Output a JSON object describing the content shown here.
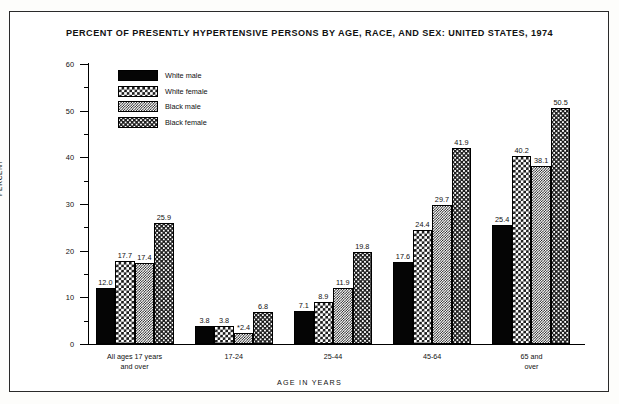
{
  "chart_data": {
    "type": "bar",
    "title": "PERCENT OF PRESENTLY HYPERTENSIVE PERSONS BY AGE, RACE, AND SEX: UNITED STATES, 1974",
    "xlabel": "AGE IN YEARS",
    "ylabel": "PERCENT",
    "ylim": [
      0,
      60
    ],
    "yticks": [
      0,
      10,
      20,
      30,
      40,
      50,
      60
    ],
    "yticks_minor": [
      5,
      15,
      25,
      35,
      45,
      55
    ],
    "ytick_labels": [
      "0",
      "10",
      "20",
      "30",
      "40",
      "50",
      "60"
    ],
    "grid": false,
    "legend_position": "upper-left-inside",
    "categories": [
      "All ages 17 years and over",
      "17-24",
      "25-44",
      "45-64",
      "65 and over"
    ],
    "category_lines": [
      [
        "All ages 17 years",
        "and over"
      ],
      [
        "17-24"
      ],
      [
        "25-44"
      ],
      [
        "45-64"
      ],
      [
        "65 and",
        "over"
      ]
    ],
    "series": [
      {
        "name": "White male",
        "pattern": "solid-black",
        "values": [
          12.0,
          3.8,
          7.1,
          17.6,
          25.4
        ],
        "labels": [
          "12.0",
          "3.8",
          "7.1",
          "17.6",
          "25.4"
        ]
      },
      {
        "name": "White female",
        "pattern": "checker-medium",
        "values": [
          17.7,
          3.8,
          8.9,
          24.4,
          40.2
        ],
        "labels": [
          "17.7",
          "3.8",
          "8.9",
          "24.4",
          "40.2"
        ]
      },
      {
        "name": "Black male",
        "pattern": "checker-dense",
        "values": [
          17.4,
          2.4,
          11.9,
          29.7,
          38.1
        ],
        "labels": [
          "17.4",
          "*2.4",
          "11.9",
          "29.7",
          "38.1"
        ]
      },
      {
        "name": "Black female",
        "pattern": "dots-sparse",
        "values": [
          25.9,
          6.8,
          19.8,
          41.9,
          50.5
        ],
        "labels": [
          "25.9",
          "6.8",
          "19.8",
          "41.9",
          "50.5"
        ]
      }
    ]
  }
}
